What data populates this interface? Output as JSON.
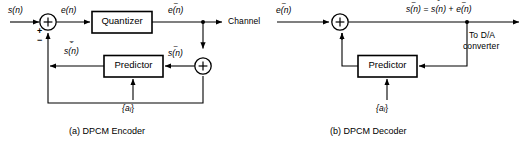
{
  "figure": {
    "type": "block-diagram",
    "line_color": "#000000",
    "background": "#ffffff"
  },
  "encoder": {
    "caption": "(a) DPCM Encoder",
    "input_label": "s(n)",
    "sum_plus": "+",
    "sum_minus": "−",
    "error_label": "e(n)",
    "quantizer_label": "Quantizer",
    "quantized_error_label": "e(n)",
    "quantized_error_accent": "~",
    "channel_label": "Channel",
    "predictor_label": "Predictor",
    "predictor_output_label": "s(n)",
    "predictor_output_accent_upper": "~",
    "predictor_output_accent_lower": "ˆ",
    "reconstructed_label": "s(n)",
    "reconstructed_accent": "~",
    "coefficients_label": "{a",
    "coefficients_sub": "i",
    "coefficients_close": "}",
    "adder_symbol": "+"
  },
  "decoder": {
    "caption": "(b) DPCM Decoder",
    "input_label": "e(n)",
    "input_accent": "~",
    "adder_symbol": "+",
    "output_eq_lhs": "s(n)",
    "output_eq_lhs_accent": "~",
    "output_eq_equals": "=",
    "output_eq_term1": "s(n)",
    "output_eq_term1_accent_upper": "~",
    "output_eq_term1_accent_lower": "ˆ",
    "output_eq_plus": "+",
    "output_eq_term2": "e(n)",
    "output_eq_term2_accent": "~",
    "destination_line1": "To D/A",
    "destination_line2": "converter",
    "predictor_label": "Predictor",
    "coefficients_label": "{a",
    "coefficients_sub": "i",
    "coefficients_close": "}"
  }
}
